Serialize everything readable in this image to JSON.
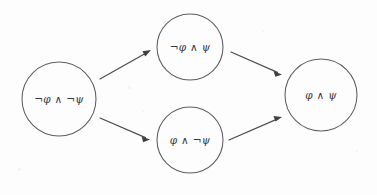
{
  "diagram": {
    "background_color": "#fdfdfd",
    "stroke_color": "#5d5d63",
    "text_color": "#37373d",
    "nodes": [
      {
        "id": "node-not-phi-and-not-psi",
        "label": "¬φ ∧ ¬ψ",
        "cx": 59,
        "cy": 99,
        "r": 37
      },
      {
        "id": "node-not-phi-and-psi",
        "label": "¬φ ∧ ψ",
        "cx": 190,
        "cy": 47,
        "r": 33
      },
      {
        "id": "node-phi-and-not-psi",
        "label": "φ ∧ ¬ψ",
        "cx": 190,
        "cy": 140,
        "r": 33
      },
      {
        "id": "node-phi-and-psi",
        "label": "φ ∧ ψ",
        "cx": 321,
        "cy": 95,
        "r": 36
      }
    ],
    "edges": [
      {
        "id": "edge-left-to-top",
        "from": "node-not-phi-and-not-psi",
        "to": "node-not-phi-and-psi",
        "x1": 100,
        "y1": 79,
        "x2": 150,
        "y2": 51
      },
      {
        "id": "edge-left-to-bottom",
        "from": "node-not-phi-and-not-psi",
        "to": "node-phi-and-not-psi",
        "x1": 100,
        "y1": 118,
        "x2": 149,
        "y2": 139
      },
      {
        "id": "edge-top-to-right",
        "from": "node-not-phi-and-psi",
        "to": "node-phi-and-psi",
        "x1": 231,
        "y1": 52,
        "x2": 281,
        "y2": 74
      },
      {
        "id": "edge-bottom-to-right",
        "from": "node-phi-and-not-psi",
        "to": "node-phi-and-psi",
        "x1": 229,
        "y1": 140,
        "x2": 281,
        "y2": 117
      }
    ]
  }
}
